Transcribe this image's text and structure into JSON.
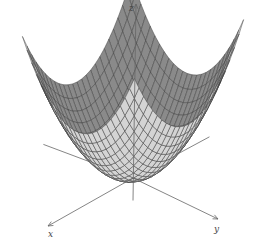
{
  "chart_data": {
    "type": "surface",
    "title": "",
    "function": "z = x^2 + y^2",
    "surface": "paraboloid",
    "axes": {
      "x": {
        "label": "x",
        "direction": "lower-left"
      },
      "y": {
        "label": "y",
        "direction": "lower-right"
      },
      "z": {
        "label": "z",
        "direction": "up"
      }
    },
    "domain": {
      "x": [
        -1,
        1
      ],
      "y": [
        -1,
        1
      ]
    },
    "grid_lines": 24,
    "grid": true,
    "legend": "none",
    "colors": {
      "outer_face": "#d4d4d4",
      "inner_face": "#8a8a8a",
      "mesh_line": "#3a3a3a",
      "axis_line": "#666666"
    }
  },
  "labels": {
    "x_axis": "x",
    "y_axis": "y",
    "z_axis": "z"
  }
}
